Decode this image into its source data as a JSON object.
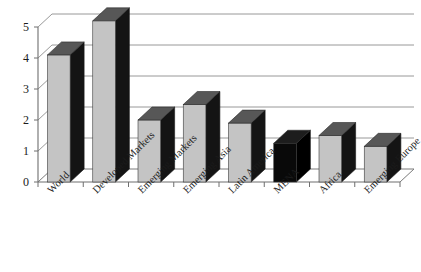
{
  "chart_data": {
    "type": "bar",
    "title": "",
    "subtitle": "",
    "xlabel": "",
    "ylabel": "",
    "categories": [
      "World",
      "Developed Markets",
      "Emerging Markets",
      "Emerging Asia",
      "Latin America",
      "MENA",
      "Africa",
      "Emerging Europe"
    ],
    "values": [
      4.1,
      5.2,
      2.0,
      2.5,
      1.9,
      1.25,
      1.5,
      1.15
    ],
    "ylim": [
      0,
      5.4
    ],
    "yticks": [
      0,
      1,
      2,
      3,
      4,
      5
    ],
    "ytick_labels": [
      "0",
      "1",
      "2",
      "3",
      "4",
      "5"
    ],
    "grid": true,
    "legend": false,
    "legend_position": "none",
    "style": "3d-column",
    "highlight_category": "MENA",
    "annotations": []
  },
  "colors": {
    "bar_face": "#c4c4c4",
    "bar_side": "#141414",
    "bar_top": "#575757",
    "highlight_face": "#090909",
    "highlight_side": "#000000",
    "highlight_top": "#1d1d1d",
    "gridline": "#8d8d8d",
    "axis": "#6e6e6e",
    "text": "#1b1b1b",
    "background": "#ffffff"
  },
  "axis": {
    "y_tick_0": "0",
    "y_tick_1": "1",
    "y_tick_2": "2",
    "y_tick_3": "3",
    "y_tick_4": "4",
    "y_tick_5": "5"
  },
  "labels": {
    "cat_0": "World",
    "cat_1": "Developed Markets",
    "cat_2": "Emerging Markets",
    "cat_3": "Emerging Asia",
    "cat_4": "Latin America",
    "cat_5": "MENA",
    "cat_6": "Africa",
    "cat_7": "Emerging Europe"
  }
}
